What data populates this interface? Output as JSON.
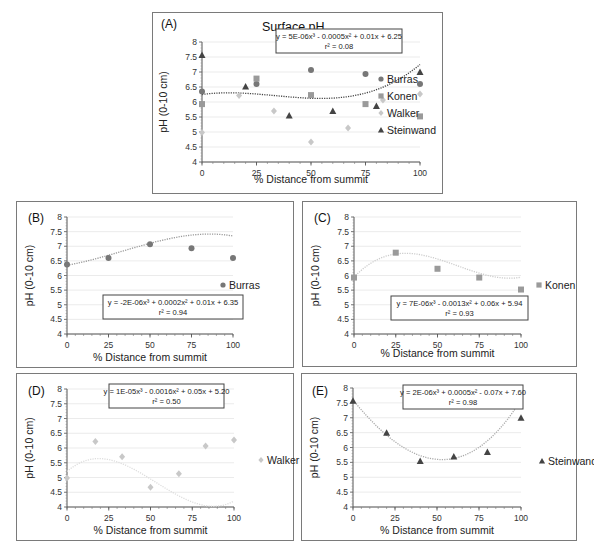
{
  "chart_data": [
    {
      "id": "A",
      "type": "scatter",
      "label": "(A)",
      "title": "Surface pH",
      "xlabel": "% Distance from summit",
      "ylabel": "pH (0-10 cm)",
      "xlim": [
        0,
        100
      ],
      "ylim": [
        4,
        8
      ],
      "xticks": [
        0,
        25,
        50,
        75,
        100
      ],
      "yticks": [
        "4",
        "4.5",
        "5",
        "5.5",
        "6",
        "6.5",
        "7",
        "7.5",
        "8"
      ],
      "grid": true,
      "legend_position": "right",
      "series": [
        {
          "name": "Burras",
          "marker": "circle",
          "color": "#777777",
          "x": [
            0,
            25,
            50,
            75,
            100
          ],
          "y": [
            6.35,
            6.6,
            7.07,
            6.93,
            6.6
          ]
        },
        {
          "name": "Konen",
          "marker": "square",
          "color": "#9a9a9a",
          "x": [
            0,
            25,
            50,
            75,
            100
          ],
          "y": [
            5.93,
            6.78,
            6.23,
            5.93,
            5.52
          ]
        },
        {
          "name": "Walker",
          "marker": "diamond",
          "color": "#c8c8c8",
          "x": [
            0,
            17,
            33,
            50,
            67,
            83,
            100
          ],
          "y": [
            4.98,
            6.22,
            5.7,
            4.67,
            5.13,
            6.07,
            6.27
          ]
        },
        {
          "name": "Steinwand",
          "marker": "triangle",
          "color": "#444444",
          "x": [
            0,
            20,
            40,
            60,
            80,
            100
          ],
          "y": [
            7.57,
            6.52,
            5.55,
            5.7,
            5.87,
            7.0
          ]
        }
      ],
      "trendline": {
        "type": "poly3",
        "coef": [
          5e-06,
          -0.0005,
          0.01,
          6.25
        ],
        "color": "#444444"
      },
      "equation": "y = 5E-06x³ - 0.0005x² + 0.01x + 6.25",
      "r2": "r² = 0.08"
    },
    {
      "id": "B",
      "type": "scatter",
      "label": "(B)",
      "xlabel": "% Distance from summit",
      "ylabel": "pH (0-10 cm)",
      "xlim": [
        0,
        100
      ],
      "ylim": [
        4,
        8
      ],
      "xticks": [
        0,
        25,
        50,
        75,
        100
      ],
      "yticks": [
        "4",
        "4.5",
        "5",
        "5.5",
        "6",
        "6.5",
        "7",
        "7.5",
        "8"
      ],
      "grid": true,
      "legend_position": "right",
      "series": [
        {
          "name": "Burras",
          "marker": "circle",
          "color": "#777777",
          "x": [
            0,
            25,
            50,
            75,
            100
          ],
          "y": [
            6.38,
            6.6,
            7.07,
            6.93,
            6.6
          ]
        }
      ],
      "trendline": {
        "type": "poly3",
        "coef": [
          -2e-06,
          0.0002,
          0.01,
          6.35
        ],
        "color": "#999999"
      },
      "equation": "y = -2E-06x³ + 0.0002x² + 0.01x + 6.35",
      "r2": "r² = 0.94"
    },
    {
      "id": "C",
      "type": "scatter",
      "label": "(C)",
      "xlabel": "% Distance from summit",
      "ylabel": "pH (0-10 cm)",
      "xlim": [
        0,
        100
      ],
      "ylim": [
        4,
        8
      ],
      "xticks": [
        0,
        25,
        50,
        75,
        100
      ],
      "yticks": [
        "4",
        "4.5",
        "5",
        "5.5",
        "6",
        "6.5",
        "7",
        "7.5",
        "8"
      ],
      "grid": true,
      "legend_position": "right",
      "series": [
        {
          "name": "Konen",
          "marker": "square",
          "color": "#9a9a9a",
          "x": [
            0,
            25,
            50,
            75,
            100
          ],
          "y": [
            5.93,
            6.78,
            6.23,
            5.93,
            5.52
          ]
        }
      ],
      "trendline": {
        "type": "poly3",
        "coef": [
          7e-06,
          -0.0013,
          0.06,
          5.94
        ],
        "color": "#cccccc"
      },
      "equation": "y = 7E-06x³ - 0.0013x² + 0.06x + 5.94",
      "r2": "r² = 0.93"
    },
    {
      "id": "D",
      "type": "scatter",
      "label": "(D)",
      "xlabel": "% Distance from summit",
      "ylabel": "pH (0-10 cm)",
      "xlim": [
        0,
        100
      ],
      "ylim": [
        4,
        8
      ],
      "xticks": [
        0,
        25,
        50,
        75,
        100
      ],
      "yticks": [
        "4",
        "4.5",
        "5",
        "5.5",
        "6",
        "6.5",
        "7",
        "7.5",
        "8"
      ],
      "grid": true,
      "legend_position": "right",
      "series": [
        {
          "name": "Walker",
          "marker": "diamond",
          "color": "#c8c8c8",
          "x": [
            0,
            17,
            33,
            50,
            67,
            83,
            100
          ],
          "y": [
            4.98,
            6.22,
            5.7,
            4.67,
            5.13,
            6.07,
            6.27
          ]
        }
      ],
      "trendline": {
        "type": "poly3",
        "coef": [
          1e-05,
          -0.0016,
          0.05,
          5.2
        ],
        "color": "#dddddd"
      },
      "equation": "y = 1E-05x³ - 0.0016x² + 0.05x + 5.20",
      "r2": "r² = 0.50"
    },
    {
      "id": "E",
      "type": "scatter",
      "label": "(E)",
      "xlabel": "% Distance from summit",
      "ylabel": "pH (0-10 cm)",
      "xlim": [
        0,
        100
      ],
      "ylim": [
        4,
        8
      ],
      "xticks": [
        0,
        25,
        50,
        75,
        100
      ],
      "yticks": [
        "4",
        "4.5",
        "5",
        "5.5",
        "6",
        "6.5",
        "7",
        "7.5",
        "8"
      ],
      "grid": true,
      "legend_position": "right",
      "series": [
        {
          "name": "Steinwand",
          "marker": "triangle",
          "color": "#444444",
          "x": [
            0,
            20,
            40,
            60,
            80,
            100
          ],
          "y": [
            7.57,
            6.5,
            5.55,
            5.7,
            5.85,
            7.0
          ]
        }
      ],
      "trendline": {
        "type": "poly3",
        "coef": [
          2e-06,
          0.0005,
          -0.07,
          7.6
        ],
        "color": "#aaaaaa"
      },
      "equation": "y = 2E-06x³ + 0.0005x² - 0.07x + 7.60",
      "r2": "r² = 0.98"
    }
  ]
}
